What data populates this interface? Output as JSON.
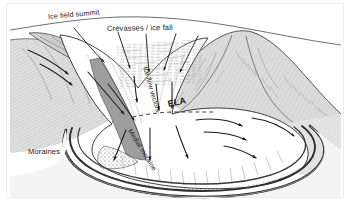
{
  "figure": {
    "kind": "line-diagram",
    "background_color": "#ffffff",
    "ink_color": "#1b1b1b",
    "ice_fill": "#ffffff",
    "rock_fill": "#dcdcdc",
    "rock_fill_dark": "#c8c8c8",
    "moraine_fill": "#9a9a9a",
    "frame_color": "#e8e8e8"
  },
  "labels": {
    "summit": "Ice field summit",
    "crevasses": "Crevasses / ice fall",
    "flow_vectors": "Ice flow vectors",
    "ela": "ELA",
    "medial_moraine": "Medial moraine",
    "moraines": "Moraines"
  },
  "annotations": {
    "leader_lines": [
      {
        "name": "summit-leader",
        "from": "Ice field summit",
        "to": "ridge-crest"
      },
      {
        "name": "crevasse-leader-1",
        "from": "Crevasses / ice fall",
        "to": "icefall-upper"
      },
      {
        "name": "crevasse-leader-2",
        "from": "Crevasses / ice fall",
        "to": "icefall-mid"
      },
      {
        "name": "crevasse-leader-3",
        "from": "Crevasses / ice fall",
        "to": "icefall-lower"
      }
    ],
    "flow_arrows_count": 14,
    "ela_line_style": "dashed",
    "terminus_type": "piedmont lobe"
  }
}
